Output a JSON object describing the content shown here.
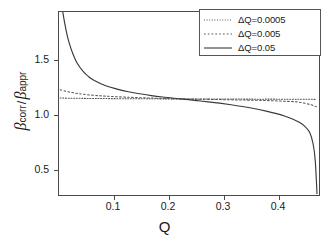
{
  "chart_data": {
    "type": "line",
    "title": "",
    "xlabel": "Q",
    "ylabel": "beta_corr / beta_appr",
    "xlim": [
      0.018,
      0.478
    ],
    "ylim": [
      0.12,
      1.78
    ],
    "grid": false,
    "legend_position": "top-right",
    "xticks": [
      0.1,
      0.2,
      0.3,
      0.4
    ],
    "xtick_labels": [
      "0.1",
      "0.2",
      "0.3",
      "0.4"
    ],
    "yticks": [
      0.5,
      1.0,
      1.5
    ],
    "ytick_labels": [
      "0.5",
      "1.0",
      "1.5"
    ],
    "series": [
      {
        "name": "ΔQ=0.0005",
        "style": "fine-dotted",
        "color": "#555555",
        "x": [
          0.02,
          0.04,
          0.06,
          0.08,
          0.1,
          0.14,
          0.18,
          0.22,
          0.24,
          0.28,
          0.32,
          0.36,
          0.4,
          0.44,
          0.47
        ],
        "y": [
          1.008,
          1.006,
          1.005,
          1.004,
          1.003,
          1.002,
          1.001,
          1.0,
          1.0,
          0.999,
          0.999,
          0.998,
          0.998,
          0.997,
          0.996
        ]
      },
      {
        "name": "ΔQ=0.005",
        "style": "dotted",
        "color": "#555555",
        "x": [
          0.02,
          0.03,
          0.04,
          0.05,
          0.06,
          0.08,
          0.1,
          0.14,
          0.18,
          0.22,
          0.24,
          0.26,
          0.3,
          0.34,
          0.38,
          0.42,
          0.44,
          0.46,
          0.47
        ],
        "y": [
          1.082,
          1.069,
          1.058,
          1.049,
          1.042,
          1.032,
          1.025,
          1.015,
          1.008,
          1.002,
          1.0,
          0.998,
          0.994,
          0.99,
          0.986,
          0.978,
          0.971,
          0.948,
          0.93
        ]
      },
      {
        "name": "ΔQ=0.05",
        "style": "solid",
        "color": "#3a3a3a",
        "x": [
          0.024,
          0.028,
          0.032,
          0.036,
          0.042,
          0.05,
          0.06,
          0.07,
          0.08,
          0.1,
          0.12,
          0.14,
          0.16,
          0.18,
          0.2,
          0.22,
          0.24,
          0.26,
          0.28,
          0.3,
          0.32,
          0.34,
          0.36,
          0.38,
          0.4,
          0.415,
          0.43,
          0.44,
          0.45,
          0.458,
          0.464,
          0.468,
          0.471
        ],
        "y": [
          1.8,
          1.68,
          1.58,
          1.5,
          1.41,
          1.32,
          1.25,
          1.2,
          1.165,
          1.118,
          1.088,
          1.064,
          1.046,
          1.03,
          1.017,
          1.006,
          0.996,
          0.985,
          0.974,
          0.962,
          0.948,
          0.932,
          0.914,
          0.893,
          0.868,
          0.845,
          0.815,
          0.79,
          0.752,
          0.7,
          0.6,
          0.44,
          0.15
        ]
      }
    ]
  },
  "axes": {
    "xlabel": "Q",
    "ylabel_num": "β",
    "ylabel_num_sub": "corr",
    "ylabel_sep": "/",
    "ylabel_den": "β",
    "ylabel_den_sub": "appr",
    "xtick_labels": [
      "0.1",
      "0.2",
      "0.3",
      "0.4"
    ],
    "ytick_labels": [
      "1.5",
      "1.0",
      "0.5"
    ]
  },
  "legend": {
    "entries": [
      {
        "label": "ΔQ=0.0005",
        "style": "fine-dotted"
      },
      {
        "label": "ΔQ=0.005",
        "style": "dotted"
      },
      {
        "label": "ΔQ=0.05",
        "style": "solid"
      }
    ]
  },
  "colors": {
    "frame": "#4a4a4a",
    "curve_solid": "#3a3a3a",
    "curve_dotted": "#555555",
    "text": "#1a1a1a",
    "background": "#ffffff"
  }
}
